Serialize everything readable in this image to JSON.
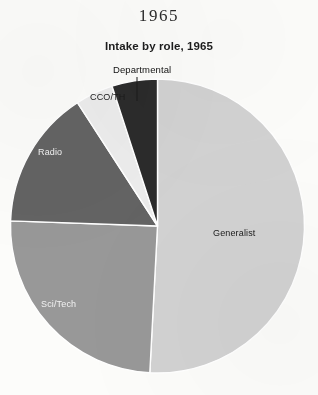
{
  "page": {
    "header": "1965",
    "background_color": "#fcfcfa"
  },
  "chart_data": {
    "type": "pie",
    "title": "Intake by role, 1965",
    "subtitle": "",
    "xlabel": "",
    "ylabel": "",
    "legend_position": "none",
    "grid": false,
    "start_angle_deg": 0,
    "direction": "clockwise",
    "categories": [
      "Generalist",
      "Sci/Tech",
      "Radio",
      "CCO/TH",
      "Departmental"
    ],
    "values": [
      50.8,
      24.7,
      15.3,
      4.2,
      5.0
    ],
    "units": "percent",
    "slices": [
      {
        "label": "Generalist",
        "value": 50.8,
        "start_deg": 0,
        "end_deg": 183,
        "color": "#d2d2d2",
        "label_color": "#1a1a1a",
        "label_placement": "inside"
      },
      {
        "label": "Sci/Tech",
        "value": 24.7,
        "start_deg": 183,
        "end_deg": 272,
        "color": "#989898",
        "label_color": "#f2f2f2",
        "label_placement": "inside"
      },
      {
        "label": "Radio",
        "value": 15.3,
        "start_deg": 272,
        "end_deg": 327,
        "color": "#636363",
        "label_color": "#f2f2f2",
        "label_placement": "inside"
      },
      {
        "label": "CCO/TH",
        "value": 4.2,
        "start_deg": 327,
        "end_deg": 342,
        "color": "#ececec",
        "label_color": "#1a1a1a",
        "label_placement": "outside"
      },
      {
        "label": "Departmental",
        "value": 5.0,
        "start_deg": 342,
        "end_deg": 360,
        "color": "#2b2b2b",
        "label_color": "#111111",
        "label_placement": "callout"
      }
    ],
    "colors": [
      "#d2d2d2",
      "#989898",
      "#636363",
      "#ececec",
      "#2b2b2b"
    ],
    "slice_border_color": "#ffffff"
  }
}
